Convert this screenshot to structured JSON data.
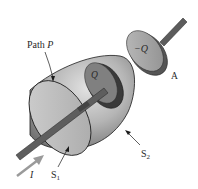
{
  "figure": {
    "labels": {
      "path_prefix": "Path ",
      "path_var": "P",
      "plate_charge": "Q",
      "plate_neg_charge": "−Q",
      "plate_a": "A",
      "surface_1": "S",
      "surface_1_sub": "1",
      "surface_2": "S",
      "surface_2_sub": "2",
      "current": "I"
    },
    "colors": {
      "surface_light": "#c9c9c9",
      "surface_dark": "#7a7a7a",
      "plate_dark": "#3a3a3a",
      "plate_face": "#8c8c8c",
      "wire": "#5a5a5a",
      "arrow": "#9a9a9a",
      "outline": "#1a1a1a"
    }
  }
}
